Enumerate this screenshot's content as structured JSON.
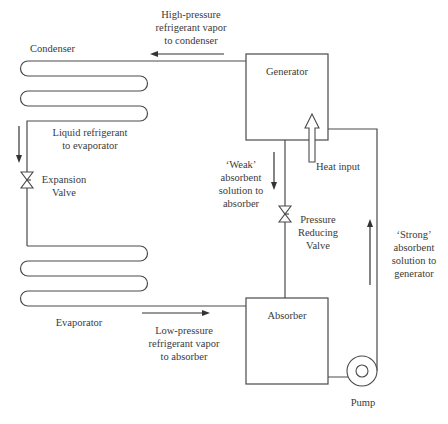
{
  "diagram": {
    "colors": {
      "line": "#4a4a4a",
      "text": "#3a3a3a",
      "background": "#ffffff"
    },
    "components": {
      "condenser": {
        "label": "Condenser"
      },
      "evaporator": {
        "label": "Evaporator"
      },
      "generator": {
        "label": "Generator"
      },
      "absorber": {
        "label": "Absorber"
      },
      "expansion_valve": {
        "label": "Expansion\nValve"
      },
      "pressure_reducing_valve": {
        "label": "Pressure\nReducing\nValve"
      },
      "pump": {
        "label": "Pump"
      }
    },
    "flows": {
      "high_pressure_vapor": {
        "label": "High-pressure\nrefrigerant vapor\nto condenser",
        "direction": "left"
      },
      "liquid_refrigerant": {
        "label": "Liquid refrigerant\nto evaporator",
        "direction": "down"
      },
      "low_pressure_vapor": {
        "label": "Low-pressure\nrefrigerant vapor\nto absorber",
        "direction": "right"
      },
      "weak_solution": {
        "label": "‘Weak’\nabsorbent\nsolution to\nabsorber",
        "direction": "down"
      },
      "strong_solution": {
        "label": "‘Strong’\nabsorbent\nsolution to\ngenerator",
        "direction": "up"
      },
      "heat_input": {
        "label": "Heat input",
        "direction": "up"
      }
    }
  }
}
